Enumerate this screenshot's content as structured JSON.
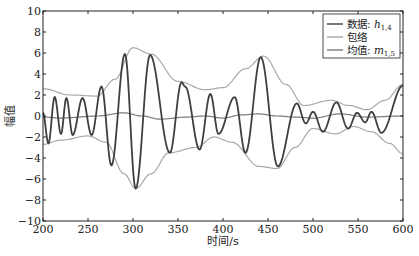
{
  "chart_data": {
    "type": "line",
    "title": "",
    "xlabel": "时间/s",
    "ylabel": "幅值",
    "xlim": [
      200,
      600
    ],
    "ylim": [
      -10,
      10
    ],
    "xticks": [
      200,
      250,
      300,
      350,
      400,
      450,
      500,
      550,
      600
    ],
    "yticks": [
      -10,
      -8,
      -6,
      -4,
      -2,
      0,
      2,
      4,
      6,
      8,
      10
    ],
    "grid": false,
    "legend_position": "upper right",
    "legend": [
      {
        "label": "数据: ",
        "math": "h",
        "sub": "1,4",
        "color": "#3f3f3f"
      },
      {
        "label": "包络",
        "math": "",
        "sub": "",
        "color": "#a8a8a8"
      },
      {
        "label": "均值: ",
        "math": "m",
        "sub": "1,5",
        "color": "#7a7a7a"
      }
    ],
    "series": [
      {
        "name": "数据: h1,4",
        "color": "#3f3f3f",
        "width": 1.8,
        "points": [
          [
            200,
            0.3
          ],
          [
            206,
            -2.6
          ],
          [
            213,
            1.8
          ],
          [
            220,
            -1.7
          ],
          [
            226,
            1.7
          ],
          [
            233,
            -1.8
          ],
          [
            244,
            1.7
          ],
          [
            254,
            -1.8
          ],
          [
            265,
            2.8
          ],
          [
            276,
            -4.7
          ],
          [
            291,
            5.9
          ],
          [
            303,
            -6.9
          ],
          [
            319,
            5.8
          ],
          [
            341,
            -3.5
          ],
          [
            354,
            3.2
          ],
          [
            358,
            2.8
          ],
          [
            374,
            -3.2
          ],
          [
            386,
            2.1
          ],
          [
            395,
            -1.7
          ],
          [
            413,
            1.8
          ],
          [
            425,
            -3.5
          ],
          [
            442,
            5.6
          ],
          [
            461,
            -4.8
          ],
          [
            482,
            1.2
          ],
          [
            492,
            -0.7
          ],
          [
            500,
            0.4
          ],
          [
            511,
            -1.5
          ],
          [
            526,
            1.3
          ],
          [
            539,
            -1.2
          ],
          [
            549,
            0.3
          ],
          [
            558,
            -0.6
          ],
          [
            565,
            0.4
          ],
          [
            576,
            -1.6
          ],
          [
            600,
            2.9
          ]
        ]
      },
      {
        "name": "包络(上)",
        "color": "#a8a8a8",
        "width": 1.2,
        "points": [
          [
            200,
            2.6
          ],
          [
            230,
            2.0
          ],
          [
            260,
            1.9
          ],
          [
            280,
            3.5
          ],
          [
            300,
            6.5
          ],
          [
            320,
            5.9
          ],
          [
            350,
            3.3
          ],
          [
            380,
            2.5
          ],
          [
            400,
            2.7
          ],
          [
            425,
            4.5
          ],
          [
            445,
            5.7
          ],
          [
            470,
            3.0
          ],
          [
            490,
            1.0
          ],
          [
            520,
            1.5
          ],
          [
            540,
            1.0
          ],
          [
            560,
            0.6
          ],
          [
            580,
            1.5
          ],
          [
            600,
            3.0
          ]
        ]
      },
      {
        "name": "包络(下)",
        "color": "#a8a8a8",
        "width": 1.2,
        "points": [
          [
            200,
            -2.7
          ],
          [
            220,
            -2.3
          ],
          [
            250,
            -1.9
          ],
          [
            270,
            -2.5
          ],
          [
            290,
            -5.5
          ],
          [
            303,
            -6.9
          ],
          [
            320,
            -5.5
          ],
          [
            340,
            -3.5
          ],
          [
            370,
            -3.0
          ],
          [
            390,
            -2.0
          ],
          [
            410,
            -2.5
          ],
          [
            440,
            -4.8
          ],
          [
            460,
            -5.0
          ],
          [
            480,
            -3.0
          ],
          [
            500,
            -1.2
          ],
          [
            525,
            -1.7
          ],
          [
            545,
            -1.0
          ],
          [
            565,
            -1.5
          ],
          [
            585,
            -2.6
          ],
          [
            600,
            -3.6
          ]
        ]
      },
      {
        "name": "均值: m1,5",
        "color": "#7a7a7a",
        "width": 1.2,
        "points": [
          [
            200,
            -0.1
          ],
          [
            220,
            -0.2
          ],
          [
            260,
            0.0
          ],
          [
            290,
            0.3
          ],
          [
            310,
            0.0
          ],
          [
            330,
            -0.3
          ],
          [
            360,
            -0.1
          ],
          [
            380,
            0.0
          ],
          [
            400,
            -0.2
          ],
          [
            420,
            0.1
          ],
          [
            440,
            0.2
          ],
          [
            460,
            0.0
          ],
          [
            480,
            -0.1
          ],
          [
            500,
            -0.2
          ],
          [
            530,
            0.2
          ],
          [
            560,
            -0.1
          ],
          [
            600,
            0.0
          ]
        ]
      }
    ]
  }
}
